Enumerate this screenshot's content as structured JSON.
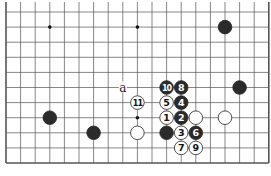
{
  "diagram": {
    "type": "go-board-fragment",
    "grid": {
      "cols": 19,
      "rows": 10,
      "x0": 6,
      "y0": 12,
      "dx": 14.6,
      "dy": 15.1,
      "open_top": true,
      "right_edge": true,
      "bottom_edge": true,
      "left_edge": true
    },
    "colors": {
      "black": "#2b2b2b",
      "white": "#ffffff",
      "line": "#555555"
    },
    "hoshi": [
      {
        "c": 3,
        "r": 1
      },
      {
        "c": 9,
        "r": 1
      },
      {
        "c": 9,
        "r": 7
      }
    ],
    "stones": [
      {
        "c": 15,
        "r": 1,
        "color": "black",
        "label": ""
      },
      {
        "c": 16,
        "r": 5,
        "color": "black",
        "label": ""
      },
      {
        "c": 3,
        "r": 7,
        "color": "black",
        "label": ""
      },
      {
        "c": 6,
        "r": 8,
        "color": "black",
        "label": ""
      },
      {
        "c": 9,
        "r": 8,
        "color": "white",
        "label": ""
      },
      {
        "c": 11,
        "r": 8,
        "color": "black",
        "label": ""
      },
      {
        "c": 13,
        "r": 7,
        "color": "white",
        "label": ""
      },
      {
        "c": 15,
        "r": 7,
        "color": "white",
        "label": ""
      },
      {
        "c": 11,
        "r": 7,
        "color": "white",
        "label": "1"
      },
      {
        "c": 12,
        "r": 7,
        "color": "black",
        "label": "2"
      },
      {
        "c": 12,
        "r": 8,
        "color": "white",
        "label": "3"
      },
      {
        "c": 12,
        "r": 6,
        "color": "black",
        "label": "4"
      },
      {
        "c": 11,
        "r": 6,
        "color": "white",
        "label": "5"
      },
      {
        "c": 13,
        "r": 8,
        "color": "black",
        "label": "6"
      },
      {
        "c": 12,
        "r": 9,
        "color": "white",
        "label": "7"
      },
      {
        "c": 12,
        "r": 5,
        "color": "black",
        "label": "8"
      },
      {
        "c": 13,
        "r": 9,
        "color": "white",
        "label": "9"
      },
      {
        "c": 11,
        "r": 5,
        "color": "black",
        "label": "10"
      },
      {
        "c": 9,
        "r": 6,
        "color": "white",
        "label": "11"
      }
    ],
    "marks": [
      {
        "c": 8,
        "r": 5,
        "label": "a"
      }
    ]
  }
}
